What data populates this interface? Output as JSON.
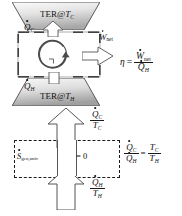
{
  "figure": {
    "colors": {
      "reservoir_fill_light": "#f2f2f2",
      "reservoir_fill_dark": "#9a9a9a",
      "outline": "#3a3a3a",
      "text": "#111111",
      "arrow_fill": "#ffffff",
      "dashed_boundary": "#1a1a1a"
    }
  },
  "top_panel": {
    "cold_reservoir": {
      "label_prefix": "TER@",
      "label_symbol": "T",
      "label_subscript": "C",
      "heat_symbol": "Q",
      "heat_subscript": "C"
    },
    "hot_reservoir": {
      "label_prefix": "TER@",
      "label_symbol": "T",
      "label_subscript": "H",
      "heat_symbol": "Q",
      "heat_subscript": "H"
    },
    "work_out": {
      "symbol": "W",
      "subscript": "net"
    },
    "cycle_icon": "cycle-arrow-icon",
    "efficiency_equation": {
      "lhs": "η",
      "equals": "=",
      "numerator_symbol": "W",
      "numerator_subscript": "net",
      "denominator_symbol": "Q",
      "denominator_subscript": "H"
    }
  },
  "bottom_panel": {
    "entropy_in_top": {
      "numerator_symbol": "Q",
      "numerator_subscript": "C",
      "denominator_symbol": "T",
      "denominator_subscript": "C"
    },
    "entropy_in_bottom": {
      "numerator_symbol": "Q",
      "numerator_subscript": "H",
      "denominator_symbol": "T",
      "denominator_subscript": "H"
    },
    "entropy_generation": {
      "symbol": "S",
      "subscript": "gen,univ",
      "equals": "=",
      "value": "0"
    },
    "carnot_relation": {
      "lhs_numerator_symbol": "Q",
      "lhs_numerator_subscript": "C",
      "lhs_denominator_symbol": "Q",
      "lhs_denominator_subscript": "H",
      "equals": "=",
      "rhs_numerator_symbol": "T",
      "rhs_numerator_subscript": "C",
      "rhs_denominator_symbol": "T",
      "rhs_denominator_subscript": "H"
    }
  }
}
